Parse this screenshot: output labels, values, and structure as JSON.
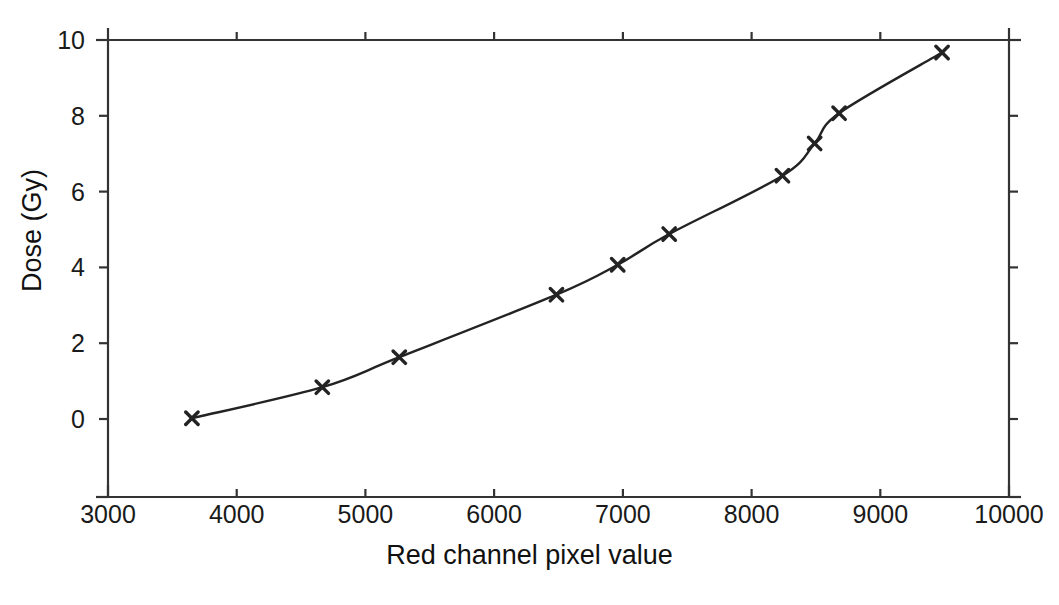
{
  "chart_data": {
    "type": "line",
    "title": "",
    "xlabel": "Red channel pixel value",
    "ylabel": "Dose (Gy)",
    "xlim": [
      3000,
      10000
    ],
    "ylim": [
      0,
      10
    ],
    "xticks": [
      3000,
      4000,
      5000,
      6000,
      7000,
      8000,
      9000,
      10000
    ],
    "yticks": [
      0,
      2,
      4,
      6,
      8,
      10
    ],
    "xtick_labels": [
      "3000",
      "4000",
      "5000",
      "6000",
      "7000",
      "8000",
      "9000",
      "10000"
    ],
    "ytick_labels": [
      "0",
      "2",
      "4",
      "6",
      "8",
      "10"
    ],
    "grid": false,
    "legend": null,
    "marker": "x-cross",
    "line_color": "#232323",
    "marker_color": "#232323",
    "series": [
      {
        "name": "Calibration curve",
        "x": [
          3652,
          4665,
          5263,
          6484,
          6960,
          7360,
          8240,
          8490,
          8680,
          9480
        ],
        "y": [
          0.02,
          0.84,
          1.63,
          3.28,
          4.07,
          4.88,
          6.42,
          7.27,
          8.07,
          9.67
        ]
      }
    ]
  },
  "axes": {
    "x_title": "Red channel pixel value",
    "y_title": "Dose (Gy)"
  }
}
